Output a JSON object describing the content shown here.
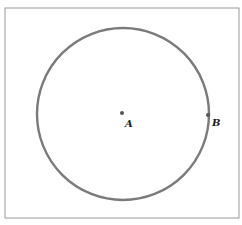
{
  "diagram": {
    "type": "geometry",
    "frame": {
      "x": 5,
      "y": 8,
      "width": 234,
      "height": 210,
      "stroke": "#9a9a9a"
    },
    "circle": {
      "cx": 123,
      "cy": 114,
      "r": 86,
      "stroke": "#7a7a7a",
      "stroke_width": 2.4
    },
    "points": [
      {
        "id": "A",
        "label": "A",
        "x": 122,
        "y": 113,
        "label_x": 125,
        "label_y": 127
      },
      {
        "id": "B",
        "label": "B",
        "x": 208,
        "y": 115,
        "label_x": 212,
        "label_y": 126
      }
    ],
    "point_color": "#555555"
  }
}
